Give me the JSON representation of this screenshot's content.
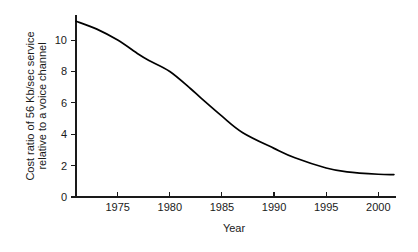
{
  "chart_data": {
    "type": "line",
    "title": "",
    "subtitle": "",
    "xlabel": "Year",
    "ylabel": "Cost ratio of 56 Kb/sec service relative to a voice channel",
    "ylabel_line1": "Cost ratio of 56 Kb/sec service",
    "ylabel_line2": "relative to a voice channel",
    "xlim": [
      1971,
      2001.7
    ],
    "ylim": [
      0,
      11.6
    ],
    "xticks": [
      1975,
      1980,
      1985,
      1990,
      1995,
      2000
    ],
    "xtick_labels": [
      "1975",
      "1980",
      "1985",
      "1990",
      "1995",
      "2000"
    ],
    "yticks": [
      0,
      2,
      4,
      6,
      8,
      10
    ],
    "ytick_labels": [
      "0",
      "2",
      "4",
      "6",
      "8",
      "10"
    ],
    "grid": false,
    "legend": false,
    "legend_position": "none",
    "annotations": [],
    "series": [
      {
        "name": "Cost ratio",
        "color": "#000000",
        "x": [
          1971,
          1973,
          1975,
          1977,
          1978,
          1980,
          1982,
          1983,
          1985,
          1987,
          1990,
          1992,
          1995,
          1997,
          2000,
          2001.5
        ],
        "values": [
          11.2,
          10.7,
          10.0,
          9.1,
          8.7,
          8.0,
          6.9,
          6.3,
          5.15,
          4.1,
          3.1,
          2.5,
          1.85,
          1.6,
          1.45,
          1.43
        ]
      }
    ]
  },
  "axes": {
    "x_axis_name": "x-axis",
    "y_axis_name": "y-axis"
  }
}
